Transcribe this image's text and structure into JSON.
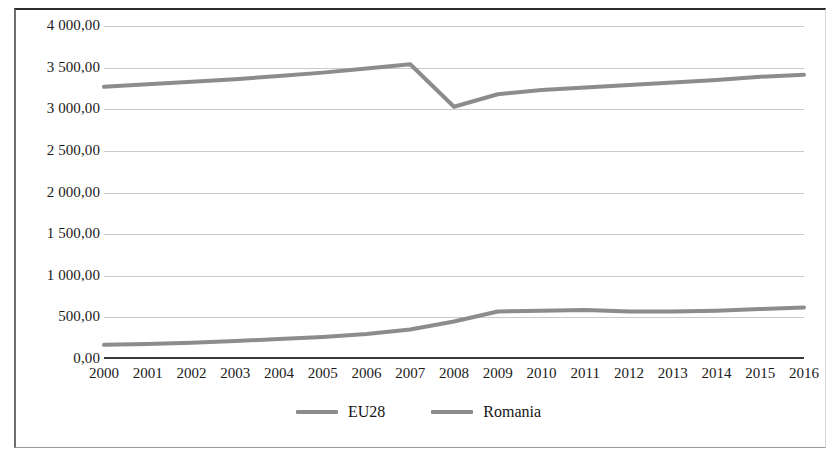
{
  "chart_data": {
    "type": "line",
    "title": "",
    "subtitle": "",
    "xlabel": "",
    "ylabel": "",
    "categories": [
      "2000",
      "2001",
      "2002",
      "2003",
      "2004",
      "2005",
      "2006",
      "2007",
      "2008",
      "2009",
      "2010",
      "2011",
      "2012",
      "2013",
      "2014",
      "2015",
      "2016"
    ],
    "series": [
      {
        "name": "EU28",
        "color": "#8c8c8c",
        "values": [
          3270,
          3300,
          3330,
          3360,
          3400,
          3440,
          3490,
          3540,
          3030,
          3180,
          3230,
          3260,
          3290,
          3320,
          3350,
          3390,
          3415
        ]
      },
      {
        "name": "Romania",
        "color": "#8c8c8c",
        "values": [
          170,
          180,
          195,
          215,
          240,
          265,
          300,
          355,
          450,
          570,
          580,
          590,
          570,
          570,
          580,
          600,
          620
        ]
      }
    ],
    "ylim": [
      0,
      4000
    ],
    "ytick_values": [
      0,
      500,
      1000,
      1500,
      2000,
      2500,
      3000,
      3500,
      4000
    ],
    "ytick_labels": [
      "0,00",
      "500,00",
      "1 000,00",
      "1 500,00",
      "2 000,00",
      "2 500,00",
      "3 000,00",
      "3 500,00",
      "4 000,00"
    ],
    "grid": true,
    "legend_position": "bottom",
    "annotations": []
  },
  "legend": {
    "entries": [
      {
        "label": "EU28",
        "color": "#8c8c8c"
      },
      {
        "label": "Romania",
        "color": "#8c8c8c"
      }
    ]
  },
  "colors": {
    "gridline": "#c9c9c9",
    "axis": "#3a3a3a",
    "frame": "#2b2b2b",
    "text": "#1a1a1a",
    "background": "#ffffff"
  }
}
